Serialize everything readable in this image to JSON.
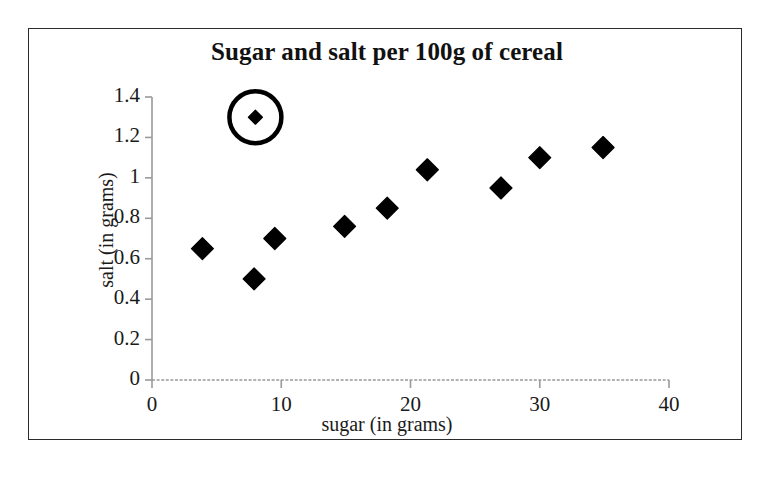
{
  "chart_data": {
    "type": "scatter",
    "title": "Sugar and salt per 100g of cereal",
    "xlabel": "sugar (in grams)",
    "ylabel": "salt (in grams)",
    "xlim": [
      0,
      40
    ],
    "ylim": [
      0,
      1.4
    ],
    "grid": false,
    "legend": null,
    "xticks": [
      "0",
      "10",
      "20",
      "30",
      "40"
    ],
    "xtick_values": [
      0,
      10,
      20,
      30,
      40
    ],
    "yticks": [
      "0",
      "0.2",
      "0.4",
      "0.6",
      "0.8",
      "1",
      "1.2",
      "1.4"
    ],
    "ytick_values": [
      0,
      0.2,
      0.4,
      0.6,
      0.8,
      1,
      1.2,
      1.4
    ],
    "marker": "diamond",
    "marker_color": "#000000",
    "series": [
      {
        "name": "cereal",
        "points": [
          {
            "x": 3.9,
            "y": 0.65,
            "circled": false
          },
          {
            "x": 7.9,
            "y": 0.5,
            "circled": false
          },
          {
            "x": 8.0,
            "y": 1.3,
            "circled": true
          },
          {
            "x": 9.5,
            "y": 0.7,
            "circled": false
          },
          {
            "x": 14.9,
            "y": 0.76,
            "circled": false
          },
          {
            "x": 18.2,
            "y": 0.85,
            "circled": false
          },
          {
            "x": 21.3,
            "y": 1.04,
            "circled": false
          },
          {
            "x": 27.0,
            "y": 0.95,
            "circled": false
          },
          {
            "x": 30.0,
            "y": 1.1,
            "circled": false
          },
          {
            "x": 34.9,
            "y": 1.15,
            "circled": false
          }
        ]
      }
    ],
    "annotations": [
      {
        "type": "circle-highlight",
        "name": "outlier-circle",
        "x": 8.0,
        "y": 1.3,
        "radius_px": 26
      }
    ]
  }
}
